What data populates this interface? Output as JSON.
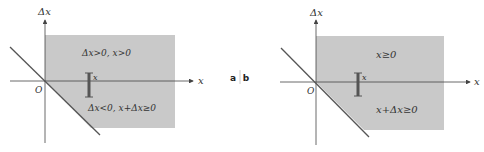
{
  "separator": {
    "left": "a",
    "right": "b"
  },
  "colors": {
    "region": "#c9c9c9",
    "axis": "#444444",
    "line": "#555555",
    "bar": "#555555",
    "text": "#333333"
  },
  "panels": [
    {
      "id": "a",
      "y_axis_label": "Δx",
      "x_axis_label": "x",
      "origin_label": "O",
      "bar_label": "x",
      "upper_region_label": "Δx>0, x>0",
      "lower_region_label": "Δx<0, x+Δx≥0"
    },
    {
      "id": "b",
      "y_axis_label": "Δx",
      "x_axis_label": "x",
      "origin_label": "O",
      "bar_label": "x",
      "upper_region_label": "x≥0",
      "lower_region_label": "x+Δx≥0"
    }
  ]
}
